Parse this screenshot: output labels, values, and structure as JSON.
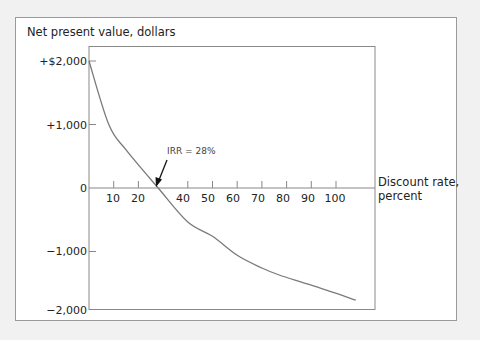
{
  "chart_data": {
    "type": "line",
    "title": "",
    "ylabel": "Net present value, dollars",
    "xlabel_line1": "Discount rate,",
    "xlabel_line2": "percent",
    "x_ticks": [
      10,
      20,
      40,
      50,
      60,
      70,
      80,
      90,
      100
    ],
    "x_tick_labels": [
      "10",
      "20",
      "40",
      "50",
      "60",
      "70",
      "80",
      "90",
      "100"
    ],
    "y_ticks": [
      2000,
      1000,
      0,
      -1000,
      -2000
    ],
    "y_tick_labels": [
      "+$2,000",
      "+1,000",
      "0",
      "−1,000",
      "−2,000"
    ],
    "xlim": [
      0,
      115
    ],
    "ylim": [
      -2000,
      2230
    ],
    "grid": false,
    "series": [
      {
        "name": "NPV",
        "x": [
          0,
          8,
          15,
          28,
          40,
          50,
          60,
          70,
          77,
          90,
          108
        ],
        "y": [
          2000,
          1000,
          600,
          0,
          -535,
          -760,
          -1060,
          -1260,
          -1370,
          -1530,
          -1765
        ]
      }
    ],
    "annotations": [
      {
        "text": "IRR = 28%",
        "x": 28,
        "y": 0
      }
    ],
    "legend": "none"
  },
  "colors": {
    "background": "#f1f1f1",
    "frame_border": "#9a9a9a",
    "curve": "#7a7a7a",
    "axis": "#888888"
  }
}
